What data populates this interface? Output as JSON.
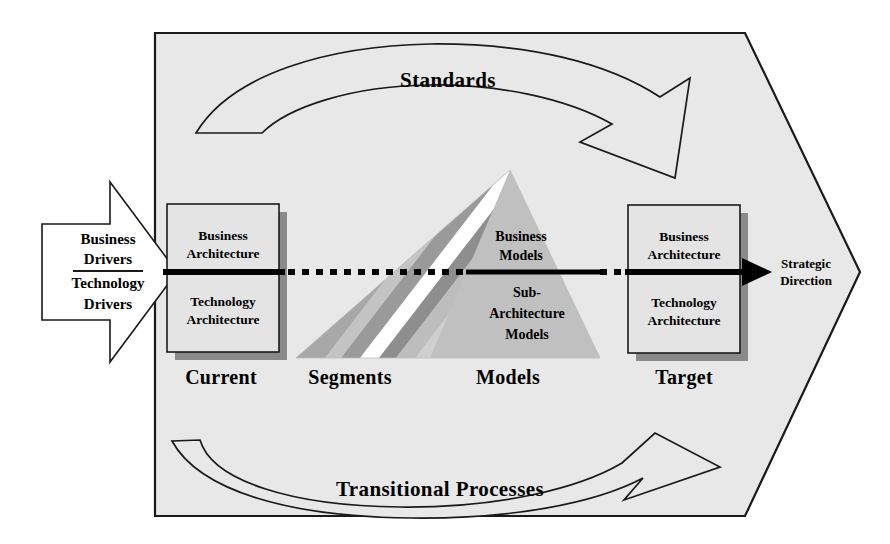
{
  "diagram": {
    "colors": {
      "page_background": "#ffffff",
      "body_fill": "#e8e8e8",
      "outline": "#1a1a1a",
      "shadow": "#7d7d7d",
      "triangle_light": "#d2d2d2",
      "triangle_mid": "#b8b8b8",
      "triangle_dark": "#9a9a9a",
      "stripe_white": "#ffffff",
      "spine": "#000000"
    },
    "input_block": {
      "name": "business-and-technology-drivers",
      "line1": "Business",
      "line2": "Drivers",
      "line3": "Technology",
      "line4": "Drivers"
    },
    "output_label": {
      "line1": "Strategic",
      "line2": "Direction"
    },
    "bands": {
      "top": "Standards",
      "bottom": "Transitional Processes"
    },
    "stage_labels": [
      {
        "key": "current",
        "label": "Current"
      },
      {
        "key": "segments",
        "label": "Segments"
      },
      {
        "key": "models",
        "label": "Models"
      },
      {
        "key": "target",
        "label": "Target"
      }
    ],
    "current_box": {
      "upper_line1": "Business",
      "upper_line2": "Architecture",
      "lower_line1": "Technology",
      "lower_line2": "Architecture"
    },
    "target_box": {
      "upper_line1": "Business",
      "upper_line2": "Architecture",
      "lower_line1": "Technology",
      "lower_line2": "Architecture"
    },
    "triangle_labels": {
      "upper_line1": "Business",
      "upper_line2": "Models",
      "lower_line1": "Sub-",
      "lower_line2": "Architecture",
      "lower_line3": "Models"
    }
  }
}
